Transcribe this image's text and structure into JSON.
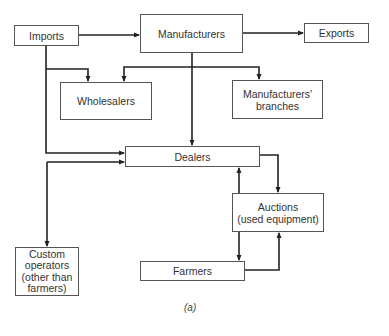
{
  "diagram": {
    "nodes": {
      "imports": {
        "label": "Imports"
      },
      "manufacturers": {
        "label": "Manufacturers"
      },
      "exports": {
        "label": "Exports"
      },
      "wholesalers": {
        "label": "Wholesalers"
      },
      "manufacturers_branches": {
        "line1": "Manufacturers'",
        "line2": "branches"
      },
      "dealers": {
        "label": "Dealers"
      },
      "auctions": {
        "line1": "Auctions",
        "line2": "(used equipment)"
      },
      "custom_operators": {
        "line1": "Custom",
        "line2": "operators",
        "line3": "(other than",
        "line4": "farmers)"
      },
      "farmers": {
        "label": "Farmers"
      }
    },
    "edges": [
      {
        "from": "Imports",
        "to": "Manufacturers"
      },
      {
        "from": "Manufacturers",
        "to": "Exports"
      },
      {
        "from": "Imports",
        "to": "Wholesalers"
      },
      {
        "from": "Manufacturers",
        "to": "Wholesalers"
      },
      {
        "from": "Manufacturers",
        "to": "Manufacturers' branches"
      },
      {
        "from": "Manufacturers",
        "to": "Dealers"
      },
      {
        "from": "Imports",
        "to": "Dealers"
      },
      {
        "from": "Dealers",
        "to": "Custom operators"
      },
      {
        "from": "Custom operators",
        "to": "Dealers"
      },
      {
        "from": "Dealers",
        "to": "Auctions"
      },
      {
        "from": "Auctions",
        "to": "Dealers"
      },
      {
        "from": "Auctions",
        "to": "Farmers"
      },
      {
        "from": "Farmers",
        "to": "Auctions"
      }
    ],
    "caption": "(a)"
  }
}
